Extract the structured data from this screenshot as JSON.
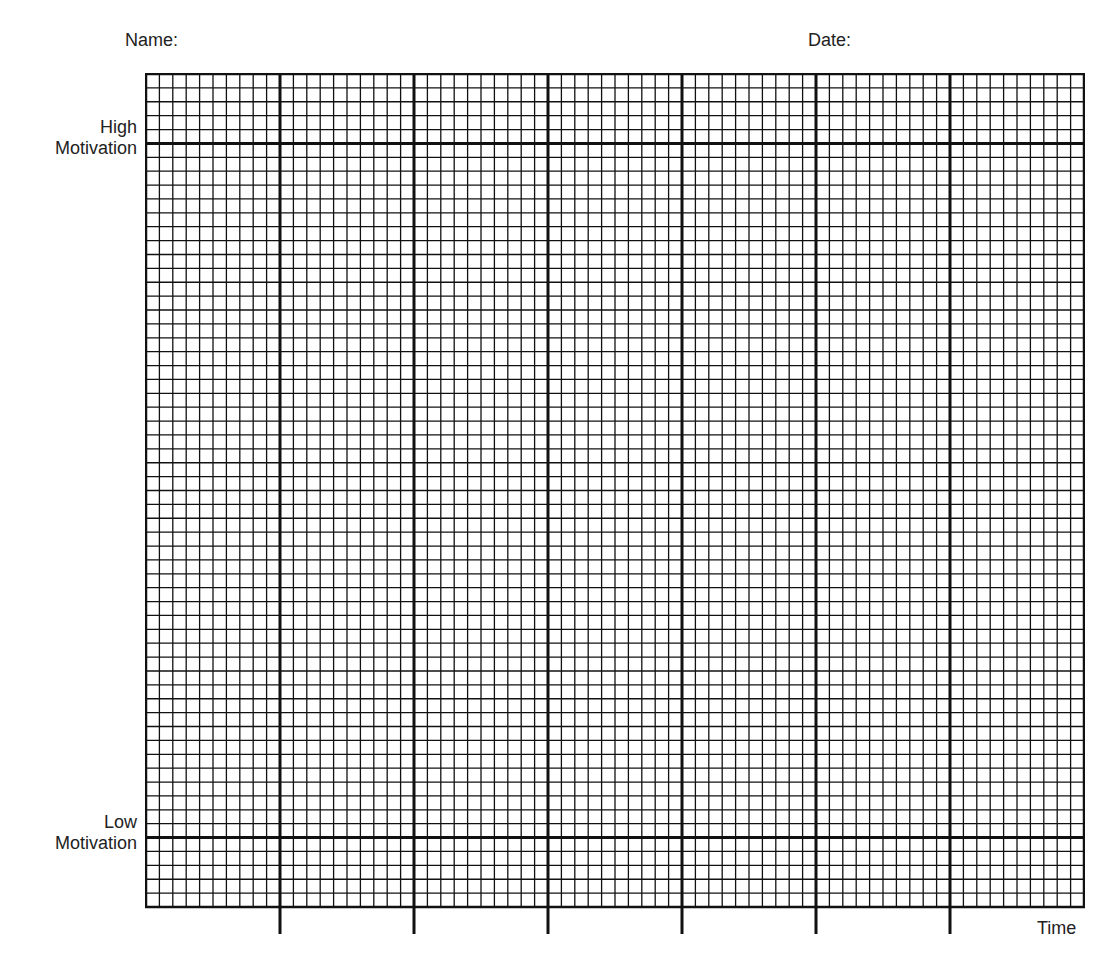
{
  "worksheet": {
    "title_fragment": "",
    "name_label": "Name:",
    "date_label": "Date:"
  },
  "chart_data": {
    "type": "line",
    "title": "",
    "xlabel": "Time",
    "ylabel": "Motivation",
    "y_labels": {
      "high": [
        "High",
        "Motivation"
      ],
      "low": [
        "Low",
        "Motivation"
      ]
    },
    "grid": {
      "columns": 70,
      "rows": 60,
      "major_column_every": 10,
      "high_line_row": 5,
      "low_line_row": 55,
      "major_ticks_below_axis": 6
    },
    "series": [],
    "grid_on": true,
    "legend": "none"
  },
  "colors": {
    "ink": "#111111",
    "paper": "#ffffff"
  }
}
